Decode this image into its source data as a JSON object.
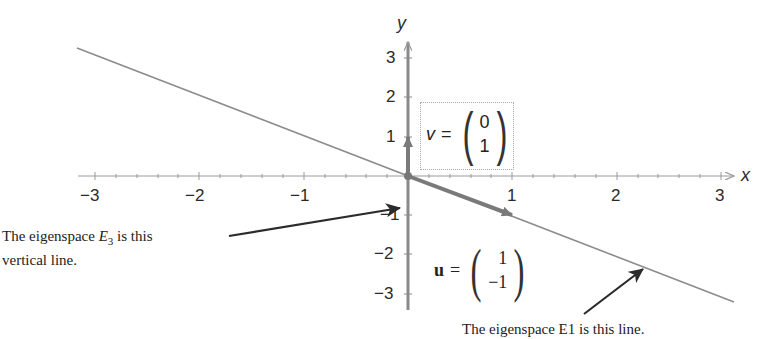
{
  "diagram": {
    "axes": {
      "x_label": "x",
      "y_label": "y",
      "x_ticks": [
        "−3",
        "−2",
        "−1",
        "1",
        "2",
        "3"
      ],
      "y_ticks": [
        "3",
        "2",
        "1",
        "−1",
        "−2",
        "−3"
      ],
      "x_range": [
        -3,
        3
      ],
      "y_range": [
        -3,
        3
      ]
    },
    "vectors": {
      "v": {
        "name": "v",
        "equals": "=",
        "components": [
          "0",
          "1"
        ]
      },
      "u": {
        "name": "u",
        "equals": "=",
        "components": [
          "1",
          "−1"
        ]
      }
    },
    "lines": {
      "eigenspace_E1": {
        "description": "line through origin with slope −1 (in units)",
        "direction": [
          1,
          -1
        ]
      },
      "eigenspace_E3": {
        "description": "vertical line (y-axis)",
        "direction": [
          0,
          1
        ]
      }
    },
    "annotations": {
      "left_caption_line1_prefix": "The eigenspace ",
      "left_caption_E": "E",
      "left_caption_sub": "3",
      "left_caption_line1_suffix": " is this",
      "left_caption_line2": "vertical line.",
      "bottom_caption": "The eigenspace E1 is this line."
    },
    "colors": {
      "axis": "#8a8a8a",
      "line": "#8c8c8c",
      "vector": "#7a7a7a",
      "arrow": "#2b2b2b",
      "text": "#222222"
    }
  }
}
